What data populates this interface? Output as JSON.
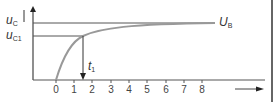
{
  "diagram": {
    "y_labels": {
      "uc": {
        "main": "u",
        "sub": "C"
      },
      "uc1": {
        "main": "u",
        "sub": "C1"
      }
    },
    "curve_label": {
      "main": "U",
      "sub": "B"
    },
    "time_marker": {
      "main": "t",
      "sub": "1"
    },
    "x_ticks": [
      "0",
      "1",
      "2",
      "3",
      "4",
      "5",
      "6",
      "7",
      "8"
    ]
  }
}
